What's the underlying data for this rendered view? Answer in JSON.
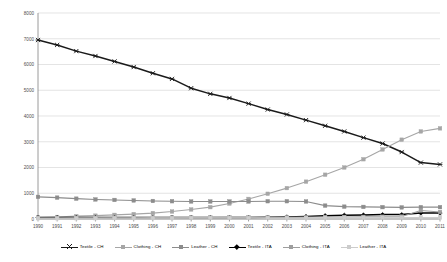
{
  "chart_data": {
    "type": "line",
    "title": "",
    "subtitle": "",
    "xlabel": "",
    "ylabel": "",
    "xlim": [
      1990,
      2011
    ],
    "ylim": [
      0,
      8000
    ],
    "ytick_step": 1000,
    "grid": true,
    "legend_position": "bottom",
    "x": [
      1990,
      1991,
      1992,
      1993,
      1994,
      1995,
      1996,
      1997,
      1998,
      1999,
      2000,
      2001,
      2002,
      2003,
      2004,
      2005,
      2006,
      2007,
      2008,
      2009,
      2010,
      2011
    ],
    "categories": [
      "1990",
      "1991",
      "1992",
      "1993",
      "1994",
      "1995",
      "1996",
      "1997",
      "1998",
      "1999",
      "2000",
      "2001",
      "2002",
      "2003",
      "2004",
      "2005",
      "2006",
      "2007",
      "2008",
      "2009",
      "2010",
      "2011"
    ],
    "yticks": [
      0,
      1000,
      2000,
      3000,
      4000,
      5000,
      6000,
      7000,
      8000
    ],
    "ytick_labels": [
      "0",
      "1000",
      "2000",
      "3000",
      "4000",
      "5000",
      "6000",
      "7000",
      "8000"
    ],
    "series": [
      {
        "name": "Textile - CH",
        "color": "#1a1a1a",
        "marker": "cross",
        "width": 1.5,
        "values": [
          6950,
          6760,
          6520,
          6330,
          6120,
          5900,
          5660,
          5440,
          5080,
          4860,
          4700,
          4480,
          4250,
          4060,
          3840,
          3620,
          3400,
          3160,
          2930,
          2600,
          2190,
          2120
        ]
      },
      {
        "name": "Clothing - CH",
        "color": "#a6a6a6",
        "marker": "square",
        "width": 1.1,
        "values": [
          60,
          80,
          110,
          130,
          160,
          190,
          230,
          290,
          370,
          460,
          600,
          780,
          980,
          1200,
          1450,
          1720,
          2000,
          2320,
          2700,
          3080,
          3400,
          3520
        ]
      },
      {
        "name": "Leather - CH",
        "color": "#8c8c8c",
        "marker": "square",
        "width": 1.1,
        "values": [
          860,
          830,
          790,
          760,
          740,
          720,
          700,
          690,
          680,
          680,
          680,
          680,
          690,
          690,
          680,
          520,
          480,
          470,
          460,
          450,
          460,
          460
        ]
      },
      {
        "name": "Textile - ITA",
        "color": "#000000",
        "marker": "diamond",
        "width": 1.5,
        "values": [
          55,
          55,
          55,
          55,
          55,
          55,
          60,
          60,
          60,
          60,
          60,
          60,
          70,
          80,
          100,
          130,
          150,
          160,
          170,
          170,
          230,
          230
        ]
      },
      {
        "name": "Clothing - ITA",
        "color": "#9e9e9e",
        "marker": "square",
        "width": 1.1,
        "values": [
          40,
          40,
          45,
          45,
          50,
          50,
          55,
          55,
          60,
          60,
          65,
          65,
          70,
          70,
          75,
          75,
          80,
          85,
          90,
          95,
          330,
          270
        ]
      },
      {
        "name": "Leather - ITA",
        "color": "#cccccc",
        "marker": "square",
        "width": 1.0,
        "values": [
          30,
          30,
          30,
          30,
          35,
          35,
          35,
          35,
          40,
          40,
          40,
          40,
          45,
          45,
          45,
          50,
          50,
          50,
          55,
          55,
          60,
          60
        ]
      }
    ]
  },
  "legend": {
    "items": [
      {
        "label": "Textile - CH",
        "color": "#1a1a1a",
        "marker": "cross"
      },
      {
        "label": "Clothing - CH",
        "color": "#a6a6a6",
        "marker": "square"
      },
      {
        "label": "Leather - CH",
        "color": "#8c8c8c",
        "marker": "square"
      },
      {
        "label": "Textile - ITA",
        "color": "#000000",
        "marker": "diamond"
      },
      {
        "label": "Clothing - ITA",
        "color": "#9e9e9e",
        "marker": "square"
      },
      {
        "label": "Leather - ITA",
        "color": "#cccccc",
        "marker": "square"
      }
    ]
  },
  "style": {
    "grid_color": "#d9d9d9",
    "axis_color": "#808080",
    "tick_label_color": "#4d4d4d",
    "background": "#ffffff"
  }
}
